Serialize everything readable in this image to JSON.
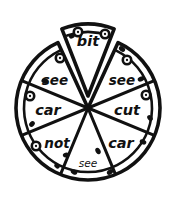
{
  "figure": {
    "background_color": "#ffffff",
    "line_color": "#111111",
    "canvas": {
      "width": 174,
      "height": 205
    }
  },
  "pizza": {
    "center": {
      "x": 88,
      "y": 108
    },
    "radius": 72,
    "crust_inner_radius": 64,
    "slice_count": 8,
    "detached_slice_index": 0,
    "detached_offset_px": 12,
    "slices": [
      {
        "index": 0,
        "label": "bit",
        "position": "top",
        "size": "sz-lg",
        "detached": true,
        "label_x": 88,
        "label_y": 42,
        "rotation": 0
      },
      {
        "index": 1,
        "label": "see",
        "position": "upper-right",
        "size": "sz-md",
        "detached": false,
        "label_x": 122,
        "label_y": 81,
        "rotation": 0
      },
      {
        "index": 2,
        "label": "cut",
        "position": "right",
        "size": "sz-lg",
        "detached": false,
        "label_x": 127,
        "label_y": 111,
        "rotation": 0
      },
      {
        "index": 3,
        "label": "car",
        "position": "lower-right",
        "size": "sz-lg",
        "detached": false,
        "label_x": 121,
        "label_y": 144,
        "rotation": 0
      },
      {
        "index": 4,
        "label": "see",
        "position": "bottom",
        "size": "sz-sm",
        "detached": false,
        "label_x": 88,
        "label_y": 164,
        "rotation": 0
      },
      {
        "index": 5,
        "label": "not",
        "position": "lower-left",
        "size": "sz-md",
        "detached": false,
        "label_x": 57,
        "label_y": 144,
        "rotation": 0
      },
      {
        "index": 6,
        "label": "car",
        "position": "left",
        "size": "sz-lg",
        "detached": false,
        "label_x": 48,
        "label_y": 111,
        "rotation": 0
      },
      {
        "index": 7,
        "label": "see",
        "position": "upper-left",
        "size": "sz-md",
        "detached": false,
        "label_x": 55,
        "label_y": 81,
        "rotation": 0
      }
    ]
  },
  "toppings": {
    "pepperoni_rings": [
      {
        "x": 78,
        "y": 32
      },
      {
        "x": 105,
        "y": 34
      },
      {
        "x": 60,
        "y": 58
      },
      {
        "x": 127,
        "y": 60
      },
      {
        "x": 30,
        "y": 96
      },
      {
        "x": 146,
        "y": 95
      },
      {
        "x": 36,
        "y": 146
      }
    ],
    "specks": [
      {
        "x": 72,
        "y": 36,
        "w": 3.2,
        "h": 2.2,
        "rot": -30
      },
      {
        "x": 122,
        "y": 49,
        "w": 3.4,
        "h": 2.4,
        "rot": 35
      },
      {
        "x": 45,
        "y": 81,
        "w": 3.6,
        "h": 2.6,
        "rot": 10
      },
      {
        "x": 141,
        "y": 79,
        "w": 3.4,
        "h": 2.4,
        "rot": -20
      },
      {
        "x": 150,
        "y": 118,
        "w": 3.2,
        "h": 2.4,
        "rot": 50
      },
      {
        "x": 32,
        "y": 124,
        "w": 3.2,
        "h": 2.4,
        "rot": -45
      },
      {
        "x": 143,
        "y": 142,
        "w": 3.4,
        "h": 2.4,
        "rot": 20
      },
      {
        "x": 98,
        "y": 151,
        "w": 3.4,
        "h": 2.4,
        "rot": 60
      },
      {
        "x": 66,
        "y": 155,
        "w": 3.2,
        "h": 2.4,
        "rot": -15
      },
      {
        "x": 74,
        "y": 172,
        "w": 3.4,
        "h": 2.4,
        "rot": 25
      },
      {
        "x": 110,
        "y": 172,
        "w": 3.4,
        "h": 2.4,
        "rot": -35
      },
      {
        "x": 57,
        "y": 166,
        "w": 3.0,
        "h": 2.2,
        "rot": 45
      }
    ]
  }
}
